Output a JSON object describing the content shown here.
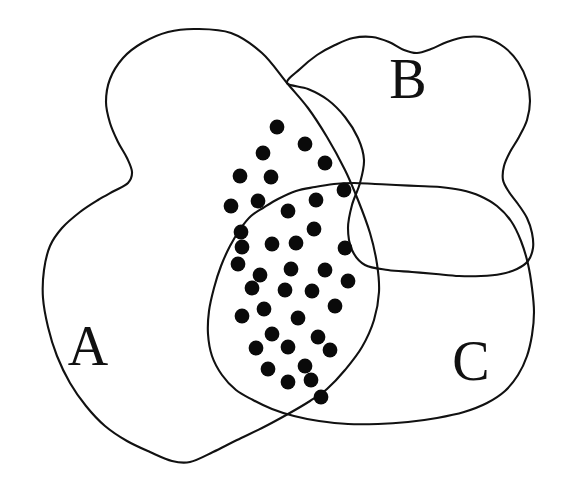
{
  "figure": {
    "type": "venn-diagram",
    "title": "",
    "background_color": "#ffffff",
    "stroke_color": "#111111",
    "dot_color": "#0a0a0a",
    "width": 566,
    "height": 482
  },
  "labels": [
    {
      "id": "A",
      "text": "A",
      "x": 88,
      "y": 365,
      "set": "set-a"
    },
    {
      "id": "B",
      "text": "B",
      "x": 408,
      "y": 98,
      "set": "set-b"
    },
    {
      "id": "C",
      "text": "C",
      "x": 471,
      "y": 380,
      "set": "set-c"
    }
  ],
  "regions": [
    {
      "id": "set-a",
      "label": "A",
      "path": "M 287 83 C 268 60 235 34 200 29 C 163 24 126 38 112 62 C 100 83 106 108 114 126 C 122 144 131 157 131 170 C 131 182 116 186 103 193 C 86 202 68 209 56 226 C 44 243 40 268 40 294 C 40 322 45 350 56 373 C 68 398 90 418 117 437 C 141 453 163 462 178 462 C 193 462 214 451 240 437 C 266 423 291 409 310 400"
    },
    {
      "id": "set-b",
      "label": "B",
      "path": "M 228 215 C 236 190 251 160 270 136 C 288 112 310 90 330 72 C 348 56 368 45 388 43 C 408 41 430 46 448 58 C 462 67 472 80 476 96 C 480 112 476 128 470 142 C 464 156 457 168 457 180 C 457 192 466 200 477 210 C 489 221 500 232 504 243 C 508 256 503 266 492 271 C 480 277 462 278 444 278 C 420 278 392 276 368 274"
    },
    {
      "id": "set-c",
      "label": "C",
      "path": "M 228 215 C 236 190 251 160 270 136 C 288 112 310 90 330 72"
    }
  ],
  "outlines": {
    "a_outline": "M 196 29 C 163 24 127 38 113 62 C 101 83 107 108 115 126 C 123 145 132 157 132 171 C 132 183 117 187 104 194 C 87 203 69 210 57 227 C 45 244 41 269 41 295 C 41 323 46 351 57 374 C 69 399 91 419 118 438 C 142 454 164 463 179 463 C 194 463 215 452 241 438 C 273 421 305 405 330 394 C 360 381 392 373 420 370 C 452 367 486 366 510 366",
    "a_outline_top": "M 196 29 C 232 33 266 59 287 83 C 303 101 317 121 329 141 C 343 163 353 183 361 203 C 371 227 377 250 379 272 C 381 296 379 319 372 339 C 364 360 350 378 333 393",
    "b_outline": "M 287 83 C 299 70 316 55 333 46 C 349 38 365 35 379 39 C 392 43 402 51 413 52 C 425 53 437 45 451 41 C 468 36 487 36 503 45 C 518 54 527 70 529 89 C 531 108 526 127 519 142 C 512 157 504 169 503 181 C 502 194 510 203 517 214 C 525 226 532 239 532 250 C 532 262 524 270 511 273 C 497 277 478 277 459 276 C 437 275 414 273 393 272",
    "c_outline": "M 263 208 C 276 200 293 192 311 188 C 327 184 344 183 359 183 C 380 183 401 185 420 186 C 441 187 462 187 480 192 C 497 197 511 207 520 221 C 529 236 534 255 536 276 C 538 300 537 325 533 347 C 529 369 522 388 512 401 C 501 415 486 424 466 430 C 444 436 417 438 390 438 C 363 438 336 435 313 430 C 292 425 275 419 262 412"
  },
  "dot_grid": {
    "radius": 7.4,
    "count": 39,
    "description": "dots filling the intersection of A and B (upper lobe) and of A, B and C (lower lobe)",
    "points": [
      [
        277,
        127
      ],
      [
        263,
        153
      ],
      [
        305,
        144
      ],
      [
        240,
        176
      ],
      [
        271,
        177
      ],
      [
        325,
        163
      ],
      [
        231,
        206
      ],
      [
        258,
        201
      ],
      [
        344,
        190
      ],
      [
        241,
        232
      ],
      [
        288,
        211
      ],
      [
        316,
        200
      ],
      [
        238,
        264
      ],
      [
        272,
        244
      ],
      [
        314,
        229
      ],
      [
        260,
        275
      ],
      [
        296,
        243
      ],
      [
        345,
        248
      ],
      [
        242,
        247
      ],
      [
        291,
        269
      ],
      [
        325,
        270
      ],
      [
        348,
        281
      ],
      [
        252,
        288
      ],
      [
        285,
        290
      ],
      [
        312,
        291
      ],
      [
        335,
        306
      ],
      [
        264,
        309
      ],
      [
        298,
        318
      ],
      [
        242,
        316
      ],
      [
        272,
        334
      ],
      [
        318,
        337
      ],
      [
        256,
        348
      ],
      [
        288,
        347
      ],
      [
        330,
        350
      ],
      [
        268,
        369
      ],
      [
        305,
        366
      ],
      [
        311,
        380
      ],
      [
        288,
        382
      ],
      [
        321,
        397
      ]
    ]
  },
  "annotations": {
    "alt_text": "Three overlapping irregular hand-drawn set regions labeled A, B and C; the overlapping central area is filled with black dots."
  }
}
